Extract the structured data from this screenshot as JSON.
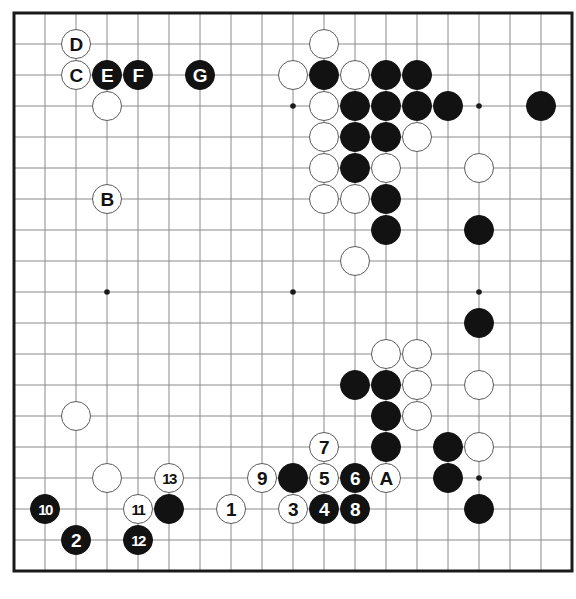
{
  "app": {
    "title": "Go Board Diagram",
    "kind": "go-game-diagram"
  },
  "board": {
    "size": 19,
    "origin_x": 14,
    "origin_y": 13,
    "spacing": 31,
    "stone_radius": 15,
    "line_color": "#8a8a8a",
    "edge_color": "#1a1a1a",
    "background_color": "#ffffff",
    "black_color": "#121212",
    "white_color": "#ffffff",
    "white_border_color": "#5a5a5a",
    "star_points": [
      {
        "col": 4,
        "row": 4
      },
      {
        "col": 10,
        "row": 4
      },
      {
        "col": 16,
        "row": 4
      },
      {
        "col": 4,
        "row": 10
      },
      {
        "col": 10,
        "row": 10
      },
      {
        "col": 16,
        "row": 10
      },
      {
        "col": 4,
        "row": 16
      },
      {
        "col": 10,
        "row": 16
      },
      {
        "col": 16,
        "row": 16
      }
    ]
  },
  "stones": [
    {
      "col": 3,
      "row": 2,
      "color": "white",
      "label": "D"
    },
    {
      "col": 3,
      "row": 3,
      "color": "white",
      "label": "C"
    },
    {
      "col": 4,
      "row": 3,
      "color": "black",
      "label": "E"
    },
    {
      "col": 5,
      "row": 3,
      "color": "black",
      "label": "F"
    },
    {
      "col": 7,
      "row": 3,
      "color": "black",
      "label": "G"
    },
    {
      "col": 4,
      "row": 4,
      "color": "white",
      "label": ""
    },
    {
      "col": 4,
      "row": 7,
      "color": "white",
      "label": "B"
    },
    {
      "col": 11,
      "row": 2,
      "color": "white",
      "label": ""
    },
    {
      "col": 10,
      "row": 3,
      "color": "white",
      "label": ""
    },
    {
      "col": 11,
      "row": 3,
      "color": "black",
      "label": ""
    },
    {
      "col": 12,
      "row": 3,
      "color": "white",
      "label": ""
    },
    {
      "col": 13,
      "row": 3,
      "color": "black",
      "label": ""
    },
    {
      "col": 14,
      "row": 3,
      "color": "black",
      "label": ""
    },
    {
      "col": 11,
      "row": 4,
      "color": "white",
      "label": ""
    },
    {
      "col": 12,
      "row": 4,
      "color": "black",
      "label": ""
    },
    {
      "col": 13,
      "row": 4,
      "color": "black",
      "label": ""
    },
    {
      "col": 14,
      "row": 4,
      "color": "black",
      "label": ""
    },
    {
      "col": 15,
      "row": 4,
      "color": "black",
      "label": ""
    },
    {
      "col": 18,
      "row": 4,
      "color": "black",
      "label": ""
    },
    {
      "col": 11,
      "row": 5,
      "color": "white",
      "label": ""
    },
    {
      "col": 12,
      "row": 5,
      "color": "black",
      "label": ""
    },
    {
      "col": 13,
      "row": 5,
      "color": "black",
      "label": ""
    },
    {
      "col": 14,
      "row": 5,
      "color": "white",
      "label": ""
    },
    {
      "col": 11,
      "row": 6,
      "color": "white",
      "label": ""
    },
    {
      "col": 12,
      "row": 6,
      "color": "black",
      "label": ""
    },
    {
      "col": 13,
      "row": 6,
      "color": "white",
      "label": ""
    },
    {
      "col": 16,
      "row": 6,
      "color": "white",
      "label": ""
    },
    {
      "col": 11,
      "row": 7,
      "color": "white",
      "label": ""
    },
    {
      "col": 12,
      "row": 7,
      "color": "white",
      "label": ""
    },
    {
      "col": 13,
      "row": 7,
      "color": "black",
      "label": ""
    },
    {
      "col": 13,
      "row": 8,
      "color": "black",
      "label": ""
    },
    {
      "col": 16,
      "row": 8,
      "color": "black",
      "label": ""
    },
    {
      "col": 12,
      "row": 9,
      "color": "white",
      "label": ""
    },
    {
      "col": 16,
      "row": 11,
      "color": "black",
      "label": ""
    },
    {
      "col": 13,
      "row": 12,
      "color": "white",
      "label": ""
    },
    {
      "col": 14,
      "row": 12,
      "color": "white",
      "label": ""
    },
    {
      "col": 12,
      "row": 13,
      "color": "black",
      "label": ""
    },
    {
      "col": 13,
      "row": 13,
      "color": "black",
      "label": ""
    },
    {
      "col": 14,
      "row": 13,
      "color": "white",
      "label": ""
    },
    {
      "col": 16,
      "row": 13,
      "color": "white",
      "label": ""
    },
    {
      "col": 13,
      "row": 14,
      "color": "black",
      "label": ""
    },
    {
      "col": 14,
      "row": 14,
      "color": "white",
      "label": ""
    },
    {
      "col": 3,
      "row": 14,
      "color": "white",
      "label": ""
    },
    {
      "col": 11,
      "row": 15,
      "color": "white",
      "label": "7"
    },
    {
      "col": 13,
      "row": 15,
      "color": "black",
      "label": ""
    },
    {
      "col": 15,
      "row": 15,
      "color": "black",
      "label": ""
    },
    {
      "col": 16,
      "row": 15,
      "color": "white",
      "label": ""
    },
    {
      "col": 4,
      "row": 16,
      "color": "white",
      "label": ""
    },
    {
      "col": 6,
      "row": 16,
      "color": "white",
      "label": "13"
    },
    {
      "col": 9,
      "row": 16,
      "color": "white",
      "label": "9"
    },
    {
      "col": 10,
      "row": 16,
      "color": "black",
      "label": ""
    },
    {
      "col": 11,
      "row": 16,
      "color": "white",
      "label": "5"
    },
    {
      "col": 12,
      "row": 16,
      "color": "black",
      "label": "6"
    },
    {
      "col": 13,
      "row": 16,
      "color": "white",
      "label": "A"
    },
    {
      "col": 15,
      "row": 16,
      "color": "black",
      "label": ""
    },
    {
      "col": 2,
      "row": 17,
      "color": "black",
      "label": "10"
    },
    {
      "col": 5,
      "row": 17,
      "color": "white",
      "label": "11"
    },
    {
      "col": 6,
      "row": 17,
      "color": "black",
      "label": ""
    },
    {
      "col": 8,
      "row": 17,
      "color": "white",
      "label": "1"
    },
    {
      "col": 10,
      "row": 17,
      "color": "white",
      "label": "3"
    },
    {
      "col": 11,
      "row": 17,
      "color": "black",
      "label": "4"
    },
    {
      "col": 12,
      "row": 17,
      "color": "black",
      "label": "8"
    },
    {
      "col": 16,
      "row": 17,
      "color": "black",
      "label": ""
    },
    {
      "col": 3,
      "row": 18,
      "color": "black",
      "label": "2"
    },
    {
      "col": 5,
      "row": 18,
      "color": "black",
      "label": "12"
    }
  ],
  "legend": {
    "move_numbers": [
      "1",
      "2",
      "3",
      "4",
      "5",
      "6",
      "7",
      "8",
      "9",
      "10",
      "11",
      "12",
      "13"
    ],
    "point_markers": [
      "A",
      "B",
      "C",
      "D",
      "E",
      "F",
      "G"
    ]
  }
}
